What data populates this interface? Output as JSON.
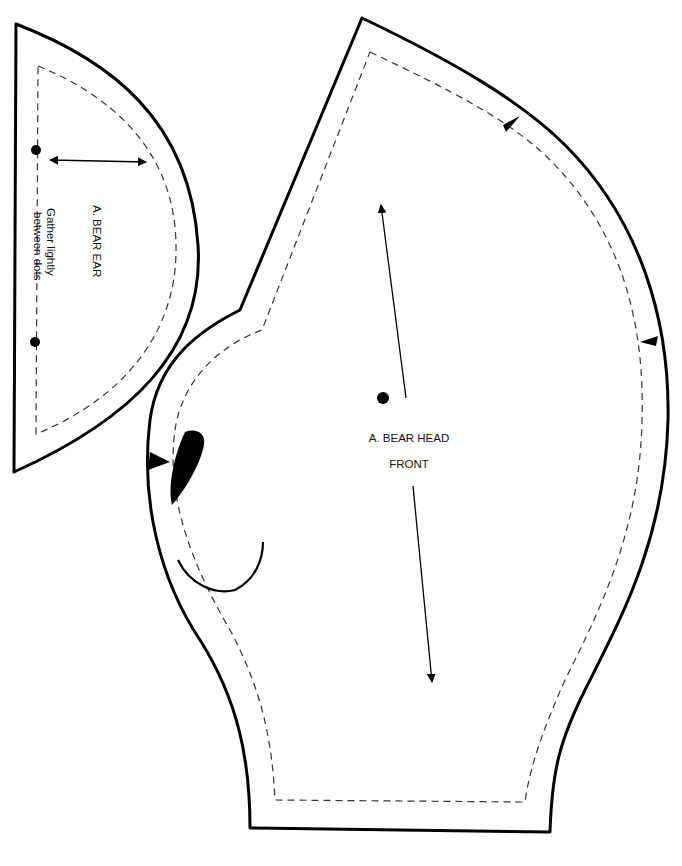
{
  "pattern_pieces": [
    {
      "id": "ear",
      "label": "A. BEAR EAR",
      "note_line1": "Gather lightly",
      "note_line2": "between dots",
      "markings": [
        "gather-dot-top",
        "gather-dot-bottom",
        "double-arrow-grainline",
        "seam-allowance-line"
      ]
    },
    {
      "id": "head-front",
      "label_line1": "A. BEAR HEAD",
      "label_line2": "FRONT",
      "markings": [
        "grainline-arrow",
        "placement-dot",
        "notch-top",
        "notch-right",
        "notch-left",
        "eye-placement",
        "mouth-curve",
        "seam-allowance-line"
      ]
    }
  ],
  "colors": {
    "line": "#000000",
    "seam": "#333333",
    "background": "#ffffff"
  }
}
